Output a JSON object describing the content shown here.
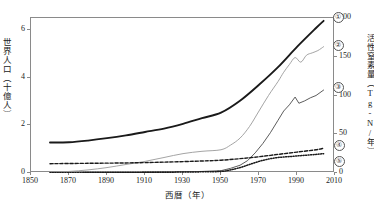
{
  "chart_data": {
    "type": "line",
    "title": "",
    "xlabel": "西暦（年）",
    "ylabel": "世界人口（十億人）",
    "ylabel_right": "活性窒素量（Tg-N/年）",
    "xlim": [
      1850,
      2010
    ],
    "ylim": [
      0,
      6.5
    ],
    "ylim_right": [
      0,
      200
    ],
    "xticks": [
      1850,
      1870,
      1890,
      1910,
      1930,
      1950,
      1970,
      1990,
      2010
    ],
    "yticks": [
      0,
      2,
      4,
      6
    ],
    "yticks_right": [
      0,
      50,
      100,
      150,
      200
    ],
    "grid": false,
    "legend_position": "right-inline-markers",
    "series": [
      {
        "name": "①",
        "label": "①",
        "axis": "left",
        "style": "solid-thick",
        "color": "#1a1a1a",
        "x": [
          1860,
          1870,
          1880,
          1890,
          1900,
          1910,
          1920,
          1930,
          1940,
          1950,
          1960,
          1970,
          1980,
          1990,
          2000,
          2004
        ],
        "values": [
          1.28,
          1.29,
          1.36,
          1.46,
          1.58,
          1.72,
          1.86,
          2.06,
          2.3,
          2.53,
          3.03,
          3.7,
          4.44,
          5.29,
          6.08,
          6.38
        ]
      },
      {
        "name": "②",
        "label": "②",
        "axis": "right",
        "style": "solid-thin-gray",
        "color": "#9a9a9a",
        "x": [
          1860,
          1870,
          1880,
          1890,
          1900,
          1910,
          1920,
          1930,
          1940,
          1950,
          1955,
          1960,
          1965,
          1970,
          1975,
          1980,
          1983,
          1986,
          1989,
          1992,
          1995,
          1998,
          2001,
          2004
        ],
        "values": [
          1,
          2,
          4,
          7,
          11,
          15,
          20,
          25,
          28,
          30,
          36,
          45,
          60,
          80,
          100,
          118,
          130,
          140,
          149,
          143,
          152,
          155,
          158,
          163
        ]
      },
      {
        "name": "③",
        "label": "③",
        "axis": "right",
        "style": "solid-thin-dark",
        "color": "#4a4a4a",
        "x": [
          1860,
          1880,
          1900,
          1920,
          1940,
          1950,
          1955,
          1960,
          1964,
          1968,
          1972,
          1976,
          1980,
          1983,
          1986,
          1989,
          1991,
          1994,
          1997,
          2000,
          2004
        ],
        "values": [
          0,
          0,
          0.5,
          1,
          2,
          3,
          6,
          10,
          16,
          26,
          38,
          52,
          68,
          80,
          88,
          98,
          90,
          93,
          97,
          100,
          107
        ]
      },
      {
        "name": "④",
        "label": "④",
        "axis": "right",
        "style": "dashed",
        "color": "#1a1a1a",
        "x": [
          1860,
          1880,
          1900,
          1920,
          1940,
          1950,
          1960,
          1970,
          1980,
          1990,
          2000,
          2004
        ],
        "values": [
          12,
          12.5,
          13,
          14,
          15.5,
          16.5,
          18.5,
          21,
          24,
          27,
          30,
          32
        ]
      },
      {
        "name": "⑤",
        "label": "⑤",
        "axis": "right",
        "style": "dotted",
        "color": "#1a1a1a",
        "x": [
          1860,
          1880,
          1900,
          1920,
          1940,
          1950,
          1955,
          1960,
          1965,
          1970,
          1975,
          1980,
          1985,
          1990,
          1995,
          2000,
          2004
        ],
        "values": [
          0.4,
          0.5,
          0.7,
          1.0,
          1.5,
          2.0,
          4,
          7,
          11,
          15,
          18,
          20,
          21,
          22,
          23,
          24,
          25
        ]
      }
    ]
  },
  "axes": {
    "left": {
      "title": "世界人口（十億人）",
      "ticks": [
        "0",
        "2",
        "4",
        "6"
      ]
    },
    "right": {
      "title": "活性窒素量（Tg-N/年）",
      "ticks": [
        "0",
        "50",
        "100",
        "150",
        "200"
      ]
    },
    "bottom": {
      "title": "西暦（年）",
      "ticks": [
        "1850",
        "1870",
        "1890",
        "1910",
        "1930",
        "1950",
        "1970",
        "1990",
        "2010"
      ]
    }
  },
  "legend": {
    "items": [
      {
        "label": "①"
      },
      {
        "label": "②"
      },
      {
        "label": "③"
      },
      {
        "label": "④"
      },
      {
        "label": "⑤"
      }
    ]
  },
  "colors": {
    "series1": "#1a1a1a",
    "series2": "#9a9a9a",
    "series3": "#4a4a4a",
    "series4": "#1a1a1a",
    "series5": "#1a1a1a",
    "axis": "#8a8a8a"
  }
}
